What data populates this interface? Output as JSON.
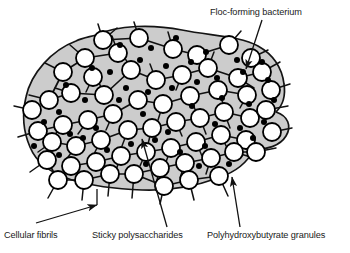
{
  "figure": {
    "colors": {
      "matrix_fill": "#cccccc",
      "cell_fill": "#ffffff",
      "outline": "#000000",
      "granule_fill": "#000000",
      "background": "#ffffff",
      "text": "#1a1a1a"
    },
    "labels": {
      "floc_bacterium": "Floc-forming bacterium",
      "cellular_fibrils": "Cellular fibrils",
      "sticky_polysaccharides": "Sticky polysaccharides",
      "phb_granules": "Polyhydroxybutyrate granules"
    },
    "counts": {
      "cells": 62,
      "granules": 46,
      "leader_lines": 4
    },
    "geometry": {
      "cell_radius_px": 9,
      "granule_radius_px": 3,
      "matrix_outline_width_px": 1.6,
      "cell_outline_width_px": 1.8,
      "fibril_width_px": 1.4
    },
    "cells": [
      [
        103,
        40
      ],
      [
        139,
        38
      ],
      [
        173,
        49
      ],
      [
        197,
        55
      ],
      [
        229,
        45
      ],
      [
        251,
        58
      ],
      [
        118,
        53
      ],
      [
        85,
        58
      ],
      [
        63,
        72
      ],
      [
        93,
        77
      ],
      [
        71,
        93
      ],
      [
        49,
        100
      ],
      [
        104,
        95
      ],
      [
        131,
        70
      ],
      [
        156,
        80
      ],
      [
        182,
        75
      ],
      [
        208,
        68
      ],
      [
        238,
        78
      ],
      [
        262,
        72
      ],
      [
        271,
        90
      ],
      [
        247,
        95
      ],
      [
        218,
        90
      ],
      [
        190,
        96
      ],
      [
        163,
        104
      ],
      [
        138,
        100
      ],
      [
        113,
        114
      ],
      [
        88,
        120
      ],
      [
        63,
        125
      ],
      [
        38,
        131
      ],
      [
        32,
        110
      ],
      [
        52,
        142
      ],
      [
        76,
        146
      ],
      [
        101,
        140
      ],
      [
        128,
        130
      ],
      [
        152,
        128
      ],
      [
        176,
        122
      ],
      [
        200,
        118
      ],
      [
        224,
        112
      ],
      [
        250,
        118
      ],
      [
        266,
        110
      ],
      [
        272,
        132
      ],
      [
        246,
        140
      ],
      [
        221,
        135
      ],
      [
        196,
        142
      ],
      [
        171,
        148
      ],
      [
        146,
        152
      ],
      [
        121,
        156
      ],
      [
        96,
        162
      ],
      [
        71,
        166
      ],
      [
        47,
        160
      ],
      [
        58,
        180
      ],
      [
        84,
        180
      ],
      [
        110,
        174
      ],
      [
        134,
        174
      ],
      [
        160,
        168
      ],
      [
        185,
        163
      ],
      [
        211,
        158
      ],
      [
        234,
        152
      ],
      [
        256,
        152
      ],
      [
        219,
        176
      ],
      [
        189,
        180
      ],
      [
        164,
        186
      ]
    ],
    "granules": [
      [
        120,
        45
      ],
      [
        151,
        48
      ],
      [
        176,
        38
      ],
      [
        206,
        52
      ],
      [
        237,
        60
      ],
      [
        262,
        62
      ],
      [
        92,
        68
      ],
      [
        66,
        85
      ],
      [
        110,
        72
      ],
      [
        140,
        60
      ],
      [
        166,
        66
      ],
      [
        191,
        62
      ],
      [
        217,
        78
      ],
      [
        243,
        72
      ],
      [
        268,
        80
      ],
      [
        85,
        100
      ],
      [
        59,
        112
      ],
      [
        126,
        88
      ],
      [
        148,
        92
      ],
      [
        172,
        88
      ],
      [
        197,
        82
      ],
      [
        222,
        98
      ],
      [
        249,
        104
      ],
      [
        274,
        100
      ],
      [
        44,
        122
      ],
      [
        70,
        134
      ],
      [
        96,
        128
      ],
      [
        119,
        100
      ],
      [
        143,
        114
      ],
      [
        168,
        132
      ],
      [
        192,
        106
      ],
      [
        215,
        124
      ],
      [
        240,
        128
      ],
      [
        264,
        122
      ],
      [
        34,
        146
      ],
      [
        59,
        155
      ],
      [
        83,
        138
      ],
      [
        107,
        150
      ],
      [
        131,
        144
      ],
      [
        155,
        140
      ],
      [
        180,
        152
      ],
      [
        205,
        146
      ],
      [
        229,
        164
      ],
      [
        253,
        138
      ],
      [
        199,
        166
      ],
      [
        146,
        164
      ]
    ],
    "fibrils": [
      [
        103,
        40,
        98,
        24
      ],
      [
        103,
        40,
        117,
        28
      ],
      [
        139,
        38,
        134,
        22
      ],
      [
        173,
        49,
        168,
        32
      ],
      [
        229,
        45,
        241,
        31
      ],
      [
        251,
        58,
        268,
        50
      ],
      [
        118,
        53,
        112,
        36
      ],
      [
        85,
        58,
        70,
        45
      ],
      [
        63,
        72,
        45,
        63
      ],
      [
        49,
        100,
        29,
        95
      ],
      [
        32,
        110,
        14,
        106
      ],
      [
        38,
        131,
        18,
        137
      ],
      [
        47,
        160,
        30,
        172
      ],
      [
        58,
        180,
        48,
        198
      ],
      [
        84,
        180,
        82,
        200
      ],
      [
        110,
        174,
        108,
        196
      ],
      [
        134,
        174,
        132,
        198
      ],
      [
        164,
        186,
        160,
        204
      ],
      [
        189,
        180,
        194,
        200
      ],
      [
        219,
        176,
        228,
        196
      ],
      [
        234,
        152,
        254,
        158
      ],
      [
        256,
        152,
        276,
        148
      ],
      [
        272,
        132,
        292,
        128
      ],
      [
        266,
        110,
        288,
        106
      ],
      [
        271,
        90,
        290,
        84
      ],
      [
        262,
        72,
        280,
        62
      ],
      [
        238,
        78,
        254,
        88
      ],
      [
        208,
        68,
        214,
        52
      ],
      [
        156,
        80,
        150,
        64
      ],
      [
        131,
        70,
        124,
        56
      ],
      [
        104,
        95,
        98,
        80
      ],
      [
        71,
        93,
        55,
        88
      ],
      [
        163,
        104,
        158,
        120
      ],
      [
        190,
        96,
        196,
        112
      ],
      [
        218,
        90,
        224,
        106
      ],
      [
        113,
        114,
        106,
        130
      ],
      [
        88,
        120,
        78,
        134
      ],
      [
        152,
        128,
        148,
        144
      ],
      [
        176,
        122,
        182,
        136
      ],
      [
        200,
        118,
        206,
        134
      ],
      [
        224,
        112,
        230,
        128
      ],
      [
        101,
        140,
        94,
        154
      ],
      [
        128,
        130,
        122,
        146
      ],
      [
        121,
        156,
        116,
        170
      ],
      [
        146,
        152,
        140,
        166
      ],
      [
        171,
        148,
        166,
        162
      ],
      [
        196,
        142,
        202,
        156
      ],
      [
        221,
        135,
        228,
        150
      ],
      [
        246,
        140,
        256,
        152
      ],
      [
        76,
        146,
        66,
        160
      ],
      [
        52,
        142,
        38,
        152
      ],
      [
        211,
        158,
        206,
        174
      ],
      [
        185,
        163,
        180,
        178
      ],
      [
        160,
        168,
        156,
        184
      ],
      [
        247,
        95,
        240,
        108
      ],
      [
        182,
        75,
        176,
        90
      ],
      [
        93,
        77,
        86,
        92
      ],
      [
        63,
        125,
        52,
        138
      ]
    ],
    "connectors": [
      [
        103,
        40,
        139,
        38
      ],
      [
        139,
        38,
        173,
        49
      ],
      [
        173,
        49,
        197,
        55
      ],
      [
        197,
        55,
        229,
        45
      ],
      [
        118,
        53,
        85,
        58
      ],
      [
        85,
        58,
        63,
        72
      ],
      [
        63,
        72,
        49,
        100
      ],
      [
        104,
        95,
        131,
        70
      ],
      [
        131,
        70,
        156,
        80
      ],
      [
        156,
        80,
        182,
        75
      ],
      [
        182,
        75,
        208,
        68
      ],
      [
        208,
        68,
        238,
        78
      ],
      [
        238,
        78,
        262,
        72
      ],
      [
        113,
        114,
        88,
        120
      ],
      [
        88,
        120,
        63,
        125
      ],
      [
        63,
        125,
        38,
        131
      ],
      [
        128,
        130,
        152,
        128
      ],
      [
        152,
        128,
        176,
        122
      ],
      [
        176,
        122,
        200,
        118
      ],
      [
        200,
        118,
        224,
        112
      ],
      [
        101,
        140,
        128,
        130
      ],
      [
        76,
        146,
        101,
        140
      ],
      [
        52,
        142,
        76,
        146
      ],
      [
        121,
        156,
        146,
        152
      ],
      [
        146,
        152,
        171,
        148
      ],
      [
        171,
        148,
        196,
        142
      ],
      [
        196,
        142,
        221,
        135
      ],
      [
        221,
        135,
        246,
        140
      ],
      [
        84,
        180,
        110,
        174
      ],
      [
        110,
        174,
        134,
        174
      ],
      [
        134,
        174,
        160,
        168
      ],
      [
        160,
        168,
        185,
        163
      ],
      [
        185,
        163,
        211,
        158
      ],
      [
        211,
        158,
        234,
        152
      ],
      [
        234,
        152,
        256,
        152
      ],
      [
        250,
        118,
        266,
        110
      ],
      [
        224,
        112,
        250,
        118
      ],
      [
        163,
        104,
        190,
        96
      ],
      [
        190,
        96,
        218,
        90
      ],
      [
        218,
        90,
        247,
        95
      ],
      [
        138,
        100,
        163,
        104
      ],
      [
        113,
        114,
        138,
        100
      ],
      [
        71,
        93,
        104,
        95
      ],
      [
        49,
        100,
        71,
        93
      ],
      [
        219,
        176,
        189,
        180
      ],
      [
        189,
        180,
        164,
        186
      ],
      [
        164,
        186,
        134,
        174
      ],
      [
        58,
        180,
        84,
        180
      ],
      [
        47,
        160,
        58,
        180
      ],
      [
        71,
        166,
        96,
        162
      ],
      [
        96,
        162,
        121,
        156
      ]
    ],
    "leaders": [
      {
        "name": "floc-bacterium-leader",
        "from": [
          262,
          20
        ],
        "to": [
          246,
          69
        ],
        "arrow": true
      },
      {
        "name": "cellular-fibrils-leader",
        "from": [
          36,
          223
        ],
        "to": [
          97,
          205
        ],
        "arrow": true,
        "tail": [
          97,
          205,
          97,
          189
        ]
      },
      {
        "name": "sticky-polysaccharides-leader",
        "from": [
          167,
          227
        ],
        "to": [
          142,
          139
        ],
        "arrow": true
      },
      {
        "name": "phb-granules-leader",
        "from": [
          240,
          227
        ],
        "to": [
          232,
          177
        ],
        "arrow": true
      }
    ]
  }
}
